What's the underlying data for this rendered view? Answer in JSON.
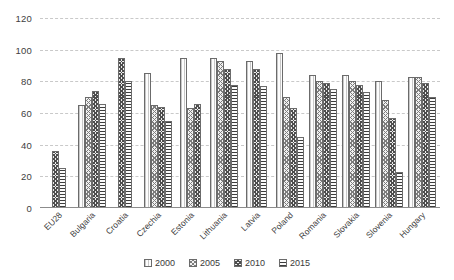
{
  "chart_data": {
    "type": "bar",
    "title": "",
    "subtitle": "",
    "xlabel": "",
    "ylabel": "",
    "ylim": [
      0,
      120
    ],
    "yticks": [
      0,
      20,
      40,
      60,
      80,
      100,
      120
    ],
    "grid": true,
    "legend_position": "bottom",
    "categories": [
      "EU28",
      "Bulgaria",
      "Croatia",
      "Czechia",
      "Estonia",
      "Lithuania",
      "Latvia",
      "Poland",
      "Romania",
      "Slovakia",
      "Slovenia",
      "Hungary"
    ],
    "series": [
      {
        "name": "2000",
        "values": [
          null,
          65,
          null,
          85,
          95,
          95,
          93,
          98,
          84,
          84,
          80,
          83
        ]
      },
      {
        "name": "2005",
        "values": [
          null,
          70,
          null,
          65,
          63,
          93,
          null,
          70,
          80,
          80,
          68,
          83
        ]
      },
      {
        "name": "2010",
        "values": [
          36,
          74,
          95,
          64,
          66,
          88,
          88,
          63,
          79,
          78,
          57,
          79
        ]
      },
      {
        "name": "2015",
        "values": [
          25,
          66,
          80,
          55,
          null,
          78,
          77,
          45,
          75,
          73,
          23,
          70
        ]
      }
    ]
  },
  "legend": {
    "items": [
      {
        "label": "2000",
        "pattern": "light-vertical"
      },
      {
        "label": "2005",
        "pattern": "light-crosshatch"
      },
      {
        "label": "2010",
        "pattern": "dark-crosshatch"
      },
      {
        "label": "2015",
        "pattern": "dark-horizontal"
      }
    ]
  },
  "colors": {
    "gridline": "#c9c9c9",
    "axis": "#8c8c8c",
    "text": "#3a3a3a",
    "background": "#ffffff"
  }
}
